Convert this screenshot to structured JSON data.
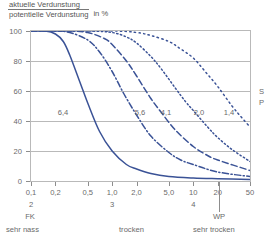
{
  "title": {
    "numerator": "aktuelle Verdunstung",
    "denominator": "potentielle Verdunstung",
    "unit": "in %"
  },
  "legend_crop": {
    "line1": "S",
    "line2": "P"
  },
  "axis_markers": {
    "fk": "FK",
    "wp": "WP",
    "pf_label_2": "2",
    "pf_label_3": "3",
    "pf_label_4": "4"
  },
  "zones": {
    "wet": "sehr nass",
    "dry": "trocken",
    "very_dry": "sehr trocken"
  },
  "colors": {
    "curve": "#3a5296",
    "grid": "#b9b9b9",
    "text": "#6a6a6a",
    "background": "#ffffff"
  },
  "chart_data": {
    "type": "line",
    "xlabel": "",
    "ylabel": "aktuelle Verdunstung / potentielle Verdunstung in %",
    "xscale": "log",
    "xlim": [
      0.1,
      50
    ],
    "ylim": [
      0,
      100
    ],
    "yticks": [
      0,
      20,
      40,
      60,
      80,
      100
    ],
    "ytick_labels": [
      "0",
      "20",
      "40",
      "60",
      "80",
      "100"
    ],
    "xticks": [
      0.1,
      0.2,
      0.5,
      1.0,
      2.0,
      5.0,
      10,
      20,
      50
    ],
    "xtick_labels": [
      "0,1",
      "0,2",
      "0,5",
      "1,0",
      "2,0",
      "5,0",
      "10",
      "20",
      "50"
    ],
    "secondary_axis": {
      "name": "pF",
      "ticks": [
        0.1,
        1.0,
        10
      ],
      "labels": [
        "2",
        "3",
        "4"
      ]
    },
    "grid": "horizontal",
    "legend": "inline-curve-labels",
    "annotations": [
      {
        "text": "FK",
        "x": 0.1
      },
      {
        "text": "WP",
        "x": 30
      },
      {
        "text": "sehr nass",
        "x": 0.1
      },
      {
        "text": "trocken",
        "x": 1.6
      },
      {
        "text": "sehr trocken",
        "x": 15
      }
    ],
    "series": [
      {
        "name": "6,4",
        "label": "6,4",
        "style": "solid",
        "x": [
          0.1,
          0.15,
          0.2,
          0.25,
          0.3,
          0.4,
          0.5,
          0.7,
          1.0,
          1.5,
          2.0,
          3.0,
          5.0,
          10,
          20,
          50
        ],
        "y": [
          100,
          100,
          98,
          93,
          84,
          66,
          52,
          33,
          20,
          11,
          8,
          5,
          3,
          2,
          1.5,
          1
        ]
      },
      {
        "name": "5,6",
        "label": "5,6",
        "style": "dashdot",
        "x": [
          0.1,
          0.2,
          0.3,
          0.5,
          0.7,
          1.0,
          1.4,
          2.0,
          3.0,
          5.0,
          7.0,
          10,
          20,
          50
        ],
        "y": [
          100,
          100,
          99,
          94,
          86,
          73,
          58,
          44,
          30,
          19,
          14,
          11,
          6,
          3
        ]
      },
      {
        "name": "4,1",
        "label": "4,1",
        "style": "dashed",
        "x": [
          0.1,
          0.3,
          0.5,
          0.8,
          1.0,
          1.5,
          2.0,
          3.0,
          4.0,
          6.0,
          10,
          15,
          20,
          50
        ],
        "y": [
          100,
          100,
          99,
          95,
          91,
          80,
          70,
          55,
          46,
          34,
          23,
          17,
          14,
          7
        ]
      },
      {
        "name": "2,0",
        "label": "2,0",
        "style": "dotted",
        "x": [
          0.1,
          0.5,
          1.0,
          1.5,
          2.0,
          3.0,
          4.0,
          6.0,
          8.0,
          10,
          15,
          20,
          30,
          50
        ],
        "y": [
          100,
          100,
          99,
          96,
          92,
          83,
          75,
          62,
          53,
          47,
          36,
          29,
          21,
          13
        ]
      },
      {
        "name": "1,4",
        "label": "1,4",
        "style": "dotted-sparse",
        "x": [
          0.1,
          1.0,
          2.0,
          3.0,
          5.0,
          7.0,
          10,
          14,
          20,
          30,
          40,
          50
        ],
        "y": [
          100,
          100,
          99,
          97,
          93,
          88,
          82,
          73,
          63,
          50,
          42,
          36
        ]
      }
    ]
  }
}
